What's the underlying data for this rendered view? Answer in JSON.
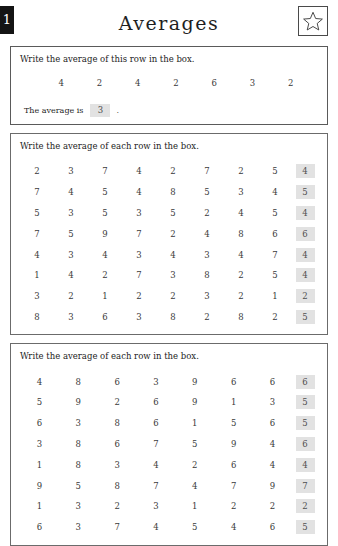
{
  "page": {
    "number": "1",
    "title": "Averages",
    "star_icon": "star-icon"
  },
  "example": {
    "instruction": "Write the average of this row in the box.",
    "numbers": [
      "4",
      "2",
      "4",
      "2",
      "6",
      "3",
      "2"
    ],
    "answer_label": "The average is",
    "answer_value": "3",
    "trailing_punctuation": "."
  },
  "section1": {
    "instruction": "Write the average of each row in the box.",
    "rows": [
      {
        "numbers": [
          "2",
          "3",
          "7",
          "4",
          "2",
          "7",
          "2",
          "5"
        ],
        "answer": "4"
      },
      {
        "numbers": [
          "7",
          "4",
          "5",
          "4",
          "8",
          "5",
          "3",
          "4"
        ],
        "answer": "5"
      },
      {
        "numbers": [
          "5",
          "3",
          "5",
          "3",
          "5",
          "2",
          "4",
          "5"
        ],
        "answer": "4"
      },
      {
        "numbers": [
          "7",
          "5",
          "9",
          "7",
          "2",
          "4",
          "8",
          "6"
        ],
        "answer": "6"
      },
      {
        "numbers": [
          "4",
          "3",
          "4",
          "3",
          "4",
          "3",
          "4",
          "7"
        ],
        "answer": "4"
      },
      {
        "numbers": [
          "1",
          "4",
          "2",
          "7",
          "3",
          "8",
          "2",
          "5"
        ],
        "answer": "4"
      },
      {
        "numbers": [
          "3",
          "2",
          "1",
          "2",
          "2",
          "3",
          "2",
          "1"
        ],
        "answer": "2"
      },
      {
        "numbers": [
          "8",
          "3",
          "6",
          "3",
          "8",
          "2",
          "8",
          "2"
        ],
        "answer": "5"
      }
    ]
  },
  "section2": {
    "instruction": "Write the average of each row in the box.",
    "rows": [
      {
        "numbers": [
          "4",
          "8",
          "6",
          "3",
          "9",
          "6",
          "6"
        ],
        "answer": "6"
      },
      {
        "numbers": [
          "5",
          "9",
          "2",
          "6",
          "9",
          "1",
          "3"
        ],
        "answer": "5"
      },
      {
        "numbers": [
          "6",
          "3",
          "8",
          "6",
          "1",
          "5",
          "6"
        ],
        "answer": "5"
      },
      {
        "numbers": [
          "3",
          "8",
          "6",
          "7",
          "5",
          "9",
          "4"
        ],
        "answer": "6"
      },
      {
        "numbers": [
          "1",
          "8",
          "3",
          "4",
          "2",
          "6",
          "4"
        ],
        "answer": "4"
      },
      {
        "numbers": [
          "9",
          "5",
          "8",
          "7",
          "4",
          "7",
          "9"
        ],
        "answer": "7"
      },
      {
        "numbers": [
          "1",
          "3",
          "2",
          "3",
          "1",
          "2",
          "2"
        ],
        "answer": "2"
      },
      {
        "numbers": [
          "6",
          "3",
          "7",
          "4",
          "5",
          "4",
          "6"
        ],
        "answer": "5"
      }
    ]
  }
}
